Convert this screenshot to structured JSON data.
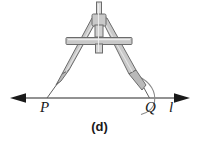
{
  "figure": {
    "caption": "(d)",
    "kind": "geometry-construction-compass",
    "background_color": "#ffffff"
  },
  "labels": {
    "point_left": "P",
    "point_right": "Q",
    "line_name": "l"
  },
  "colors": {
    "line_stroke": "#6e6e6e",
    "arrow_fill": "#1a1a1a",
    "compass_fill": "#c9c9c9",
    "compass_fill_light": "#dcdcdc",
    "compass_stroke": "#6b6b6b",
    "arc_stroke": "#8a8a8a",
    "text": "#1a1a1a"
  },
  "geometry": {
    "line_y": 98,
    "line_x_start": 12,
    "line_x_end": 188,
    "point_P_x": 47,
    "point_Q_x": 149,
    "hinge_x": 99,
    "hinge_y": 20,
    "crossbar_x_start": 66,
    "crossbar_x_end": 132,
    "crossbar_y": 41,
    "arc_center_x": 149,
    "arc_center_y": 98
  }
}
